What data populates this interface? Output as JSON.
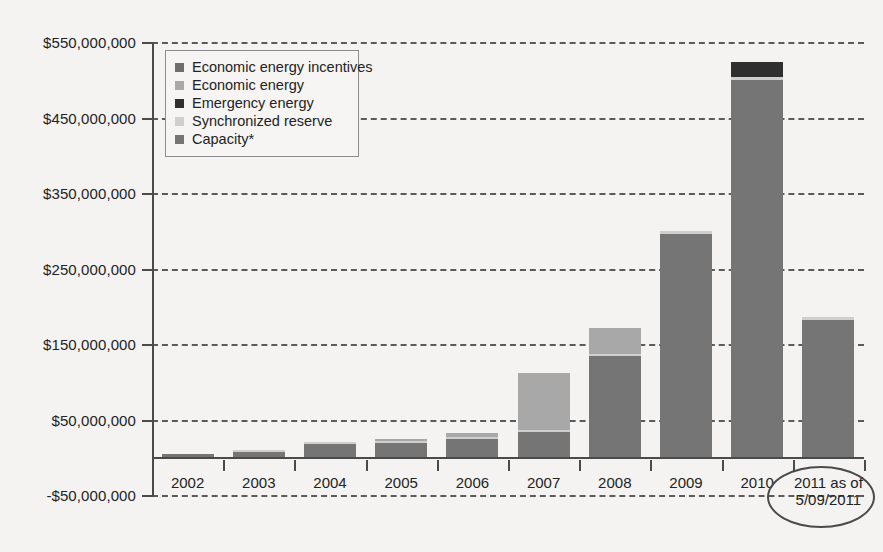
{
  "chart_data": {
    "type": "bar",
    "stacked": true,
    "title": "",
    "subtitle": "",
    "xlabel": "",
    "ylabel": "",
    "categories": [
      "2002",
      "2003",
      "2004",
      "2005",
      "2006",
      "2007",
      "2008",
      "2009",
      "2010",
      "2011 as of\n5/09/2011"
    ],
    "ylim": [
      -50000000,
      550000000
    ],
    "ytick_labels": [
      "$550,000,000",
      "$450,000,000",
      "$350,000,000",
      "$250,000,000",
      "$150,000,000",
      "$50,000,000",
      "-$50,000,000"
    ],
    "ytick_values": [
      550000000,
      450000000,
      350000000,
      250000000,
      150000000,
      50000000,
      -50000000
    ],
    "ytick_interval": 100000000,
    "grid": true,
    "grid_style": "dashed",
    "legend_position": "upper-left-inside",
    "series": [
      {
        "name": "Economic energy incentives",
        "color": "#6e6e6e",
        "values": [
          0,
          0,
          0,
          0,
          0,
          0,
          0,
          0,
          0,
          0
        ]
      },
      {
        "name": "Economic energy",
        "color": "#a8a8a8",
        "values": [
          0,
          0,
          0,
          3000000,
          6000000,
          75000000,
          35000000,
          0,
          0,
          0
        ]
      },
      {
        "name": "Emergency energy",
        "color": "#2f2f2f",
        "values": [
          0,
          0,
          0,
          0,
          0,
          0,
          0,
          0,
          20000000,
          0
        ]
      },
      {
        "name": "Synchronized reserve",
        "color": "#cfcfcf",
        "values": [
          0,
          1000000,
          1000000,
          1000000,
          1000000,
          1000000,
          1000000,
          4000000,
          4000000,
          4000000
        ]
      },
      {
        "name": "Capacity*",
        "color": "#757575",
        "values": [
          4000000,
          7000000,
          17000000,
          19000000,
          24000000,
          34000000,
          134000000,
          296000000,
          500000000,
          182000000
        ]
      }
    ],
    "totals": [
      4000000,
      8000000,
      18000000,
      23000000,
      31000000,
      110000000,
      170000000,
      300000000,
      524000000,
      186000000
    ],
    "annotations": [
      {
        "type": "ellipse",
        "target": "2011 as of 5/09/2011",
        "note": "hand-drawn oval circling the last x-axis category label"
      }
    ],
    "footnote": "*"
  },
  "legend": {
    "items": [
      {
        "label": "Economic energy incentives",
        "color": "#6e6e6e"
      },
      {
        "label": "Economic energy",
        "color": "#a8a8a8"
      },
      {
        "label": "Emergency energy",
        "color": "#2f2f2f"
      },
      {
        "label": "Synchronized reserve",
        "color": "#cfcfcf"
      },
      {
        "label": "Capacity*",
        "color": "#757575"
      }
    ]
  }
}
